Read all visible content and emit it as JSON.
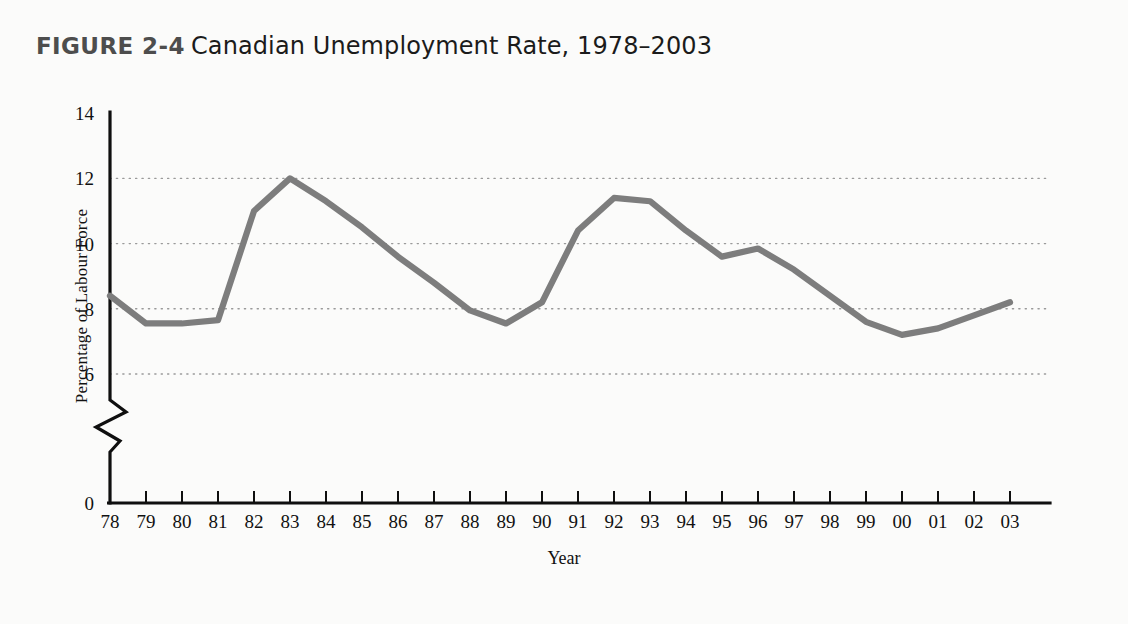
{
  "figure": {
    "number": "FIGURE 2-4",
    "title": "Canadian Unemployment Rate, 1978–2003"
  },
  "chart_data": {
    "type": "line",
    "title": "Canadian Unemployment Rate, 1978–2003",
    "xlabel": "Year",
    "ylabel": "Percentage of Labour Force",
    "x_tick_labels": [
      "78",
      "79",
      "80",
      "81",
      "82",
      "83",
      "84",
      "85",
      "86",
      "87",
      "88",
      "89",
      "90",
      "91",
      "92",
      "93",
      "94",
      "95",
      "96",
      "97",
      "98",
      "99",
      "00",
      "01",
      "02",
      "03"
    ],
    "categories": [
      1978,
      1979,
      1980,
      1981,
      1982,
      1983,
      1984,
      1985,
      1986,
      1987,
      1988,
      1989,
      1990,
      1991,
      1992,
      1993,
      1994,
      1995,
      1996,
      1997,
      1998,
      1999,
      2000,
      2001,
      2002,
      2003
    ],
    "values": [
      8.4,
      7.55,
      7.55,
      7.65,
      11.0,
      12.0,
      11.3,
      10.5,
      9.6,
      8.8,
      7.95,
      7.55,
      8.2,
      10.4,
      11.4,
      11.3,
      10.4,
      9.6,
      9.85,
      9.2,
      8.4,
      7.6,
      7.2,
      7.4,
      7.8,
      8.2
    ],
    "y_tick_labels": [
      "0",
      "6",
      "8",
      "10",
      "12",
      "14"
    ],
    "y_tick_values": [
      0,
      6,
      8,
      10,
      12,
      14
    ],
    "ylim": [
      6,
      14
    ],
    "axis_break": true,
    "grid": "horizontal-dotted",
    "legend": "none",
    "series_color": "#7d7d7d",
    "series_name": "Unemployment rate"
  },
  "colors": {
    "line": "#7d7d7d",
    "axis": "#0f0f0f",
    "grid": "#9a9a9a",
    "figure_number": "#4d4d4d",
    "background": "#fbfbfa"
  }
}
